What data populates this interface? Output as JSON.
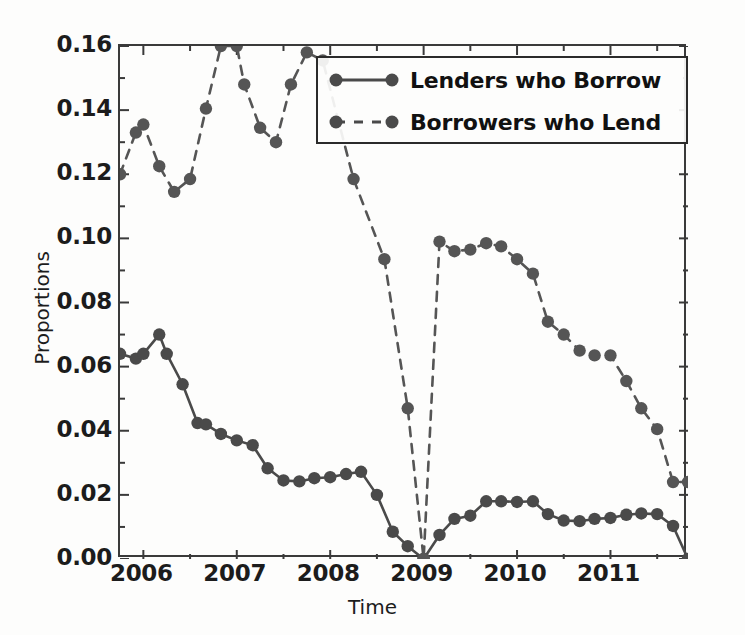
{
  "chart_data": {
    "type": "line",
    "title": "",
    "xlabel": "Time",
    "ylabel": "Proportions",
    "xlim": [
      2005.75,
      2011.83
    ],
    "ylim": [
      0.0,
      0.16
    ],
    "grid": false,
    "legend_position": "upper right",
    "x_ticks": [
      2006,
      2007,
      2008,
      2009,
      2010,
      2011
    ],
    "x_tick_labels": [
      "2006",
      "2007",
      "2008",
      "2009",
      "2010",
      "2011"
    ],
    "y_ticks": [
      0.0,
      0.02,
      0.04,
      0.06,
      0.08,
      0.1,
      0.12,
      0.14,
      0.16
    ],
    "y_tick_labels": [
      "0.00",
      "0.02",
      "0.04",
      "0.06",
      "0.08",
      "0.10",
      "0.12",
      "0.14",
      "0.16"
    ],
    "series": [
      {
        "name": "Lenders who Borrow",
        "style": "solid",
        "marker": "circle",
        "color": "#4a4a4a",
        "x": [
          2005.75,
          2005.92,
          2006.0,
          2006.17,
          2006.25,
          2006.42,
          2006.58,
          2006.67,
          2006.83,
          2007.0,
          2007.17,
          2007.33,
          2007.5,
          2007.67,
          2007.83,
          2008.0,
          2008.17,
          2008.33,
          2008.5,
          2008.67,
          2008.83,
          2009.0,
          2009.17,
          2009.33,
          2009.5,
          2009.67,
          2009.83,
          2010.0,
          2010.17,
          2010.33,
          2010.5,
          2010.67,
          2010.83,
          2011.0,
          2011.17,
          2011.33,
          2011.5,
          2011.67,
          2011.83
        ],
        "y": [
          0.064,
          0.0625,
          0.064,
          0.07,
          0.064,
          0.0545,
          0.0424,
          0.042,
          0.039,
          0.037,
          0.0355,
          0.0283,
          0.0245,
          0.0242,
          0.0252,
          0.0255,
          0.0265,
          0.0272,
          0.02,
          0.0085,
          0.004,
          0.0,
          0.0075,
          0.0125,
          0.0135,
          0.018,
          0.018,
          0.0178,
          0.018,
          0.014,
          0.012,
          0.0118,
          0.0125,
          0.0128,
          0.0138,
          0.0142,
          0.014,
          0.0103,
          0.0
        ]
      },
      {
        "name": "Borrowers who Lend",
        "style": "dashed",
        "marker": "circle",
        "color": "#555555",
        "x": [
          2005.75,
          2005.92,
          2006.0,
          2006.17,
          2006.33,
          2006.5,
          2006.67,
          2006.83,
          2007.0,
          2007.08,
          2007.25,
          2007.42,
          2007.58,
          2007.75,
          2007.92,
          2008.25,
          2008.58,
          2008.83,
          2009.0,
          2009.17,
          2009.33,
          2009.5,
          2009.67,
          2009.83,
          2010.0,
          2010.17,
          2010.33,
          2010.5,
          2010.67,
          2010.83,
          2011.0,
          2011.17,
          2011.33,
          2011.5,
          2011.67,
          2011.83
        ],
        "y": [
          0.12,
          0.133,
          0.1355,
          0.1225,
          0.1145,
          0.1185,
          0.1405,
          0.16,
          0.16,
          0.148,
          0.1345,
          0.13,
          0.148,
          0.158,
          0.1555,
          0.1185,
          0.0935,
          0.047,
          0.0,
          0.099,
          0.096,
          0.0965,
          0.0985,
          0.0975,
          0.0935,
          0.089,
          0.074,
          0.07,
          0.065,
          0.0635,
          0.0635,
          0.0555,
          0.047,
          0.0405,
          0.024,
          0.024
        ]
      }
    ]
  },
  "axis": {
    "ylabel": "Proportions",
    "xlabel": "Time"
  },
  "legend": {
    "entries": [
      {
        "label": "Lenders who Borrow",
        "style": "solid"
      },
      {
        "label": "Borrowers who Lend",
        "style": "dashed"
      }
    ]
  },
  "colors": {
    "marker": "#4a4a4a",
    "line": "#4a4a4a",
    "axis": "#3a3a3a",
    "text": "#1c1c1c",
    "background": "#fdfdfc"
  }
}
